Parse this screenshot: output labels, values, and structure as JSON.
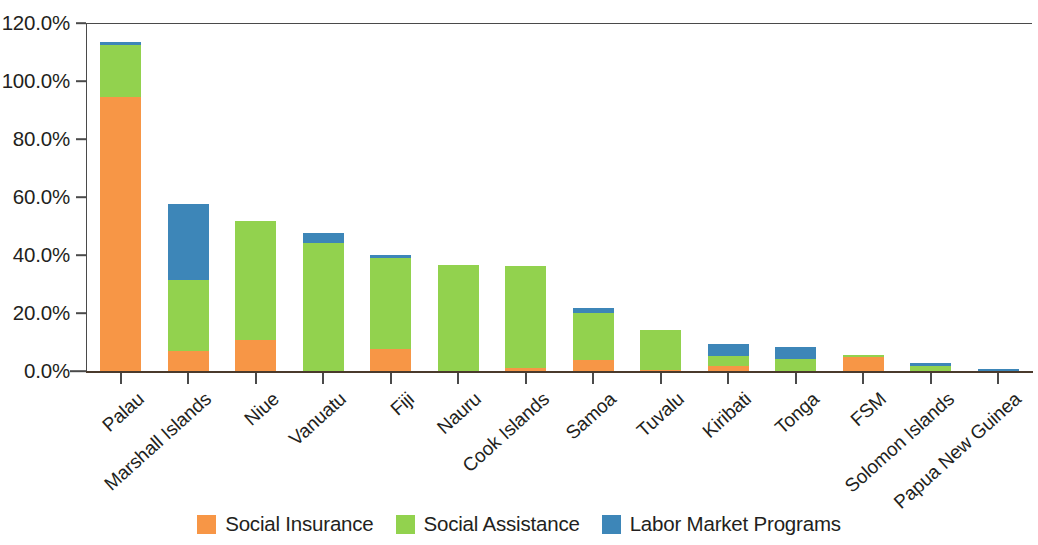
{
  "chart_data": {
    "type": "bar",
    "stacked": true,
    "title": "",
    "subtitle": "",
    "xlabel": "",
    "ylabel": "",
    "ylim": [
      0,
      120
    ],
    "ytick_labels": [
      "0.0%",
      "20.0%",
      "40.0%",
      "60.0%",
      "80.0%",
      "100.0%",
      "120.0%"
    ],
    "ytick_values": [
      0,
      20,
      40,
      60,
      80,
      100,
      120
    ],
    "grid": false,
    "legend_position": "bottom",
    "categories": [
      "Palau",
      "Marshall Islands",
      "Niue",
      "Vanuatu",
      "Fiji",
      "Nauru",
      "Cook Islands",
      "Samoa",
      "Tuvalu",
      "Kiribati",
      "Tonga",
      "FSM",
      "Solomon Islands",
      "Papua New Guinea"
    ],
    "series": [
      {
        "name": "Social Insurance",
        "color": "#f79646",
        "values": [
          94.8,
          7.4,
          11.2,
          0.0,
          7.8,
          0.0,
          1.4,
          4.0,
          0.6,
          2.0,
          0.0,
          5.2,
          0.2,
          0.0
        ]
      },
      {
        "name": "Social Assistance",
        "color": "#92d24e",
        "values": [
          17.8,
          24.3,
          40.8,
          44.6,
          31.6,
          37.0,
          35.2,
          16.4,
          13.9,
          3.4,
          4.6,
          0.6,
          1.9,
          0.4
        ]
      },
      {
        "name": "Labor Market Programs",
        "color": "#3d86b8",
        "values": [
          1.2,
          26.3,
          0.0,
          3.4,
          0.8,
          0.0,
          0.0,
          1.6,
          0.0,
          4.1,
          3.9,
          0.0,
          0.9,
          0.5
        ]
      }
    ],
    "totals": [
      113.8,
      58.0,
      52.0,
      48.0,
      40.2,
      37.0,
      36.6,
      22.0,
      14.5,
      9.5,
      8.5,
      5.8,
      3.0,
      0.9
    ]
  },
  "legend": {
    "items": [
      {
        "label": "Social Insurance",
        "color": "#f79646",
        "swatch": "orange-swatch"
      },
      {
        "label": "Social Assistance",
        "color": "#92d24e",
        "swatch": "green-swatch"
      },
      {
        "label": "Labor Market Programs",
        "color": "#3d86b8",
        "swatch": "blue-swatch"
      }
    ]
  }
}
